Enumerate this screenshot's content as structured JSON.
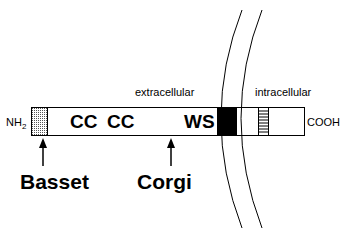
{
  "diagram": {
    "regions": {
      "extracellular": "extracellular",
      "intracellular": "intracellular"
    },
    "termini": {
      "n_terminus": "NH",
      "n_terminus_sub": "2",
      "c_terminus": "COOH"
    },
    "domains": {
      "cc1": "CC",
      "cc2": "CC",
      "ws": "WS"
    },
    "mutations": [
      {
        "label": "Basset"
      },
      {
        "label": "Corgi"
      }
    ],
    "colors": {
      "stroke": "#000000",
      "transmembrane": "#000000",
      "signal_peptide": "#bbbbbb",
      "background": "#ffffff"
    }
  }
}
